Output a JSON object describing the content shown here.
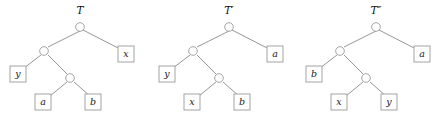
{
  "figure": {
    "kind": "binary-tree-diagram",
    "panel_count": 3,
    "background_color": "#ffffff",
    "stroke_color": "#8a8a8a",
    "text_color": "#1a1a1a"
  },
  "trees": [
    {
      "title": "T",
      "leaves": {
        "root_right": "x",
        "level2_left": "y",
        "level3_left": "a",
        "level3_right": "b"
      }
    },
    {
      "title": "T′",
      "leaves": {
        "root_right": "a",
        "level2_left": "y",
        "level3_left": "x",
        "level3_right": "b"
      }
    },
    {
      "title": "T″",
      "leaves": {
        "root_right": "a",
        "level2_left": "b",
        "level3_left": "x",
        "level3_right": "y"
      }
    }
  ]
}
